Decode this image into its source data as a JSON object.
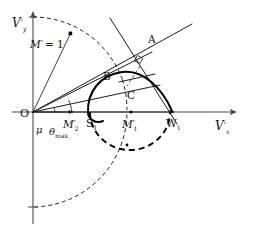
{
  "figure": {
    "background_color": "#ffffff",
    "curve_color": "#000000",
    "axis_color": "#4a4a4a"
  },
  "axes": {
    "x_axis": {
      "name": "horizontal-velocity-axis",
      "label_main": "V",
      "label_prime": "'",
      "label_sub": "x",
      "full_label": "V'x"
    },
    "y_axis": {
      "name": "vertical-velocity-axis",
      "label_main": "V",
      "label_prime": "'",
      "label_sub": "y",
      "full_label": "V'y"
    },
    "origin_label": "O"
  },
  "points": [
    {
      "id": "A",
      "label": "A",
      "x": 147,
      "y": 46,
      "kind": "intersection"
    },
    {
      "id": "B",
      "label": "B",
      "x": 110,
      "y": 75,
      "kind": "curve-point"
    },
    {
      "id": "C",
      "label": "C",
      "x": 129,
      "y": 90,
      "kind": "tangency-point"
    },
    {
      "id": "S1",
      "label": "S",
      "sublabel": "1",
      "x": 90,
      "y": 112,
      "kind": "axis-point"
    },
    {
      "id": "W1",
      "label": "W",
      "sublabel": "1",
      "x": 170,
      "y": 112,
      "kind": "axis-point"
    },
    {
      "id": "M2p",
      "label": "M",
      "prime": "'",
      "sublabel": "2",
      "x": 70,
      "y": 112,
      "kind": "axis-marker"
    },
    {
      "id": "M1p",
      "label": "M",
      "prime": "'",
      "sublabel": "1",
      "x": 131,
      "y": 112,
      "kind": "axis-marker"
    }
  ],
  "labels": {
    "unit_circle": {
      "text": "M' = 1",
      "main": "M",
      "prime": "'",
      "equals": "= 1"
    },
    "mu": "μ",
    "theta_max": {
      "main": "θ",
      "sub": "max"
    },
    "point_A": "A",
    "point_B": "B",
    "point_C": "C",
    "origin": "O",
    "S1": {
      "main": "S",
      "sub": "1"
    },
    "W1": {
      "main": "W",
      "sub": "1"
    },
    "M1_prime": {
      "main": "M",
      "prime": "'",
      "sub": "1"
    },
    "M2_prime": {
      "main": "M",
      "prime": "'",
      "sub": "2"
    }
  },
  "geometry": {
    "origin_px": {
      "x": 33,
      "y": 112
    },
    "sonic_circle_radius_px": 95,
    "shock_polar": {
      "type": "closed-loop",
      "left_point": "S1",
      "right_point": "W1",
      "apex": {
        "x": 128,
        "y": 72
      }
    },
    "rays": [
      {
        "name": "unit-circle-ray",
        "angle_label": "M' = 1"
      },
      {
        "name": "mu-ray",
        "angle_label": "μ"
      },
      {
        "name": "theta-max-ray",
        "angle_label": "θmax"
      },
      {
        "name": "OA-ray",
        "through": "A"
      },
      {
        "name": "normal-line",
        "through": "A"
      },
      {
        "name": "W1A-line",
        "through": [
          "W1",
          "A"
        ]
      }
    ],
    "right_angle_marker": {
      "at": "A",
      "size_px": 7
    }
  }
}
